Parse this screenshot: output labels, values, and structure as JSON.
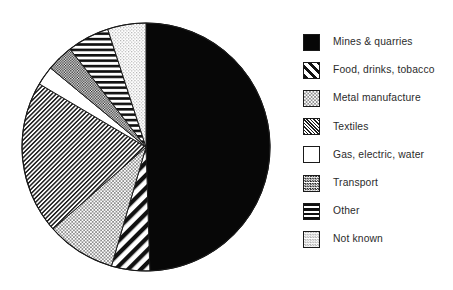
{
  "chart_data": {
    "type": "pie",
    "title": "",
    "subtitle": "",
    "xlabel": "",
    "ylabel": "",
    "grid": false,
    "legend_position": "right",
    "start_angle_deg": 0,
    "direction": "clockwise",
    "categories": [
      "Mines & quarries",
      "Food, drinks, tobacco",
      "Metal manufacture",
      "Textiles",
      "Gas, electric, water",
      "Transport",
      "Other",
      "Not known"
    ],
    "values": [
      49.5,
      5.0,
      9.0,
      20.0,
      2.5,
      3.5,
      5.5,
      5.0
    ],
    "units": "percent",
    "slices": [
      {
        "label": "Mines & quarries",
        "value": 49.5,
        "pattern": "solid-black",
        "swatch": "solid-black"
      },
      {
        "label": "Food, drinks, tobacco",
        "value": 5.0,
        "pattern": "bold-diagonal",
        "swatch": "bold-diagonal"
      },
      {
        "label": "Metal manufacture",
        "value": 9.0,
        "pattern": "light-checker",
        "swatch": "light-checker"
      },
      {
        "label": "Textiles",
        "value": 20.0,
        "pattern": "fine-diagonal",
        "swatch": "fine-diagonal"
      },
      {
        "label": "Gas, electric, water",
        "value": 2.5,
        "pattern": "white-empty",
        "swatch": "white-empty"
      },
      {
        "label": "Transport",
        "value": 3.5,
        "pattern": "dark-checker",
        "swatch": "dark-checker"
      },
      {
        "label": "Other",
        "value": 5.5,
        "pattern": "horizontal-lines",
        "swatch": "horizontal-lines"
      },
      {
        "label": "Not known",
        "value": 5.0,
        "pattern": "light-dots",
        "swatch": "light-dots"
      }
    ]
  },
  "legend": {
    "items": [
      {
        "label": "Mines & quarries"
      },
      {
        "label": "Food, drinks, tobacco"
      },
      {
        "label": "Metal manufacture"
      },
      {
        "label": "Textiles"
      },
      {
        "label": "Gas, electric, water"
      },
      {
        "label": "Transport"
      },
      {
        "label": "Other"
      },
      {
        "label": "Not known"
      }
    ]
  },
  "colors": {
    "ink": "#1a1a1a",
    "text": "#2b2b2b",
    "background": "#ffffff"
  },
  "geometry": {
    "center_x": 146,
    "center_y": 147,
    "radius": 124
  }
}
